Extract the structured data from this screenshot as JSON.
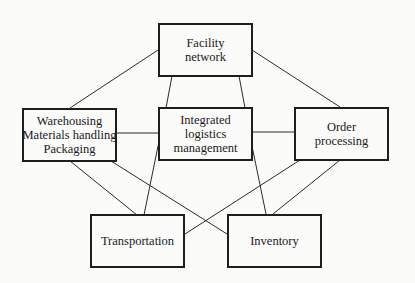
{
  "diagram": {
    "nodes": [
      {
        "id": "facility",
        "lines": [
          "Facility",
          "network"
        ]
      },
      {
        "id": "warehousing",
        "lines": [
          "Warehousing",
          "Materials handling",
          "Packaging"
        ]
      },
      {
        "id": "integrated",
        "lines": [
          "Integrated",
          "logistics",
          "management"
        ]
      },
      {
        "id": "order",
        "lines": [
          "Order",
          "processing"
        ]
      },
      {
        "id": "transportation",
        "lines": [
          "Transportation"
        ]
      },
      {
        "id": "inventory",
        "lines": [
          "Inventory"
        ]
      }
    ],
    "edges": [
      {
        "from": "facility",
        "to": "warehousing"
      },
      {
        "from": "facility",
        "to": "order"
      },
      {
        "from": "facility",
        "to": "integrated"
      },
      {
        "from": "facility",
        "to": "integrated"
      },
      {
        "from": "warehousing",
        "to": "integrated"
      },
      {
        "from": "integrated",
        "to": "order"
      },
      {
        "from": "warehousing",
        "to": "transportation"
      },
      {
        "from": "warehousing",
        "to": "inventory"
      },
      {
        "from": "integrated",
        "to": "transportation"
      },
      {
        "from": "integrated",
        "to": "inventory"
      },
      {
        "from": "order",
        "to": "transportation"
      },
      {
        "from": "order",
        "to": "inventory"
      }
    ]
  }
}
